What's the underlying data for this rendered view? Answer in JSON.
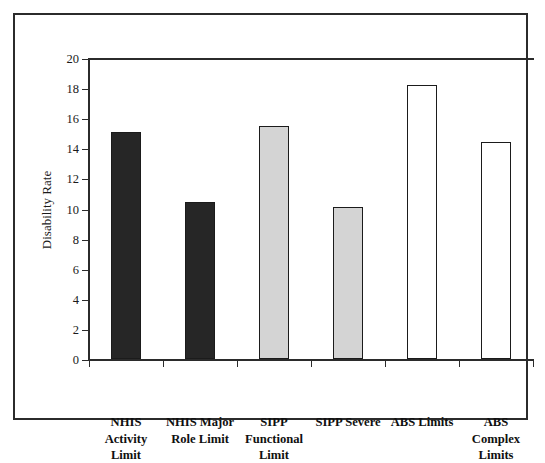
{
  "chart_data": {
    "type": "bar",
    "title": "",
    "xlabel": "",
    "ylabel": "Disability Rate",
    "ylim": [
      0,
      20
    ],
    "ytick_interval": 2,
    "yticks": [
      "0",
      "2",
      "4",
      "6",
      "8",
      "10",
      "12",
      "14",
      "16",
      "18",
      "20"
    ],
    "grid": false,
    "legend": "none",
    "categories": [
      "NHIS\nActivity\nLimit",
      "NHIS Major\nRole Limit",
      "SIPP\nFunctional\nLimit",
      "SIPP Severe",
      "ABS Limits",
      "ABS\nComplex\nLimits"
    ],
    "values": [
      15.1,
      10.4,
      15.5,
      10.1,
      18.2,
      14.4
    ],
    "bar_fills": [
      "#262626",
      "#262626",
      "#d4d4d4",
      "#d4d4d4",
      "#ffffff",
      "#ffffff"
    ],
    "bar_edge_color": "#1b1b1b"
  },
  "figure": {
    "frame_color": "#2b2b2b",
    "background": "#ffffff",
    "axis_color": "#2b2b2b"
  }
}
